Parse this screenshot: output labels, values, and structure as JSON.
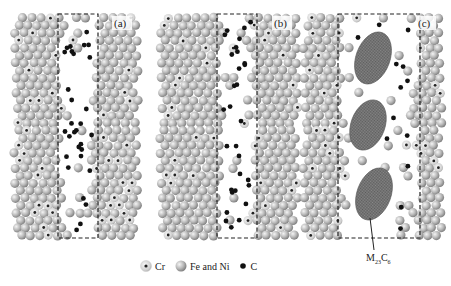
{
  "figure": {
    "panels": [
      {
        "id": "a",
        "label": "(a)",
        "box": {
          "x": 58,
          "y": 14,
          "w": 40,
          "h": 224
        },
        "carbides": []
      },
      {
        "id": "b",
        "label": "(b)",
        "box": {
          "x": 217,
          "y": 14,
          "w": 40,
          "h": 224
        },
        "carbides": []
      },
      {
        "id": "c",
        "label": "(c)",
        "box": {
          "x": 338,
          "y": 14,
          "w": 82,
          "h": 224
        },
        "carbides": [
          {
            "cx": 373,
            "cy": 58,
            "rx": 17,
            "ry": 27,
            "rot": 20
          },
          {
            "cx": 368,
            "cy": 125,
            "rx": 17,
            "ry": 26,
            "rot": 20
          },
          {
            "cx": 374,
            "cy": 194,
            "rx": 17,
            "ry": 27,
            "rot": 20
          }
        ]
      }
    ],
    "carbide_callout": {
      "label_main": "M",
      "sub1": "23",
      "label_c": "C",
      "sub2": "6"
    }
  },
  "legend": {
    "items": [
      {
        "symbol": "cr-atom-icon",
        "label": "Cr"
      },
      {
        "symbol": "fe-ni-atom-icon",
        "label": "Fe and Ni"
      },
      {
        "symbol": "carbon-atom-icon",
        "label": "C"
      }
    ]
  },
  "colors": {
    "atom_light": "#e6e6e6",
    "atom_mid": "#b4b4b4",
    "atom_dark": "#7c7c7c",
    "carbon": "#111111",
    "carbide_fill": "#777777",
    "dash": "#222222"
  }
}
